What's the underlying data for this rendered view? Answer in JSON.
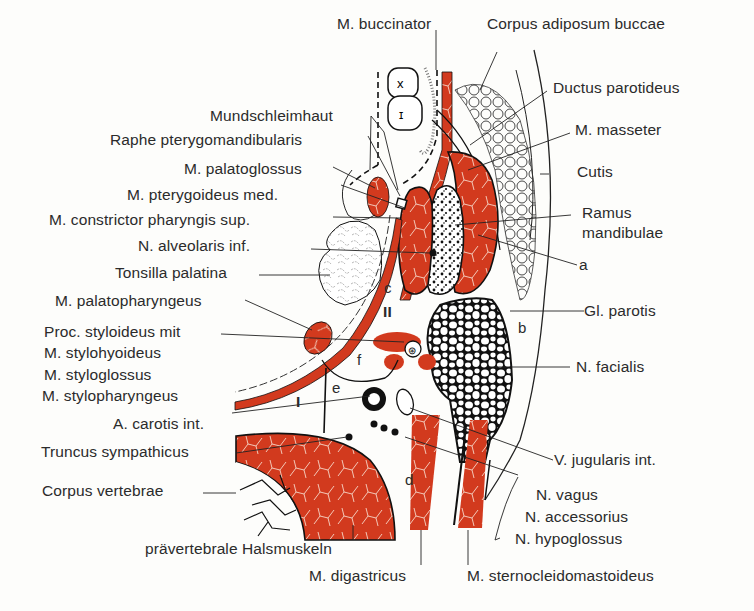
{
  "figure": {
    "colors": {
      "muscle": "#d23a1e",
      "muscle_fiber": "#f6d7c8",
      "outline": "#1a1a1a",
      "background": "#fdfdfb",
      "text": "#2b2b2b"
    },
    "labels_left": [
      {
        "id": "mundschleimhaut",
        "text": "Mundschleimhaut"
      },
      {
        "id": "raphe",
        "text": "Raphe pterygomandibularis"
      },
      {
        "id": "palatoglossus",
        "text": "M. palatoglossus"
      },
      {
        "id": "pterygoideus",
        "text": "M. pterygoideus med."
      },
      {
        "id": "constrictor",
        "text": "M. constrictor pharyngis sup."
      },
      {
        "id": "alveolaris",
        "text": "N. alveolaris inf."
      },
      {
        "id": "tonsilla",
        "text": "Tonsilla palatina"
      },
      {
        "id": "palatopharyngeus",
        "text": "M. palatopharyngeus"
      },
      {
        "id": "styloideus",
        "text": "Proc. styloideus mit"
      },
      {
        "id": "stylohyoideus",
        "text": "M. stylohyoideus"
      },
      {
        "id": "styloglossus",
        "text": "M. styloglossus"
      },
      {
        "id": "stylopharyngeus",
        "text": "M. stylopharyngeus"
      },
      {
        "id": "carotis",
        "text": "A. carotis int."
      },
      {
        "id": "sympathicus",
        "text": "Truncus sympathicus"
      },
      {
        "id": "vertebrae",
        "text": "Corpus vertebrae"
      }
    ],
    "labels_top": [
      {
        "id": "buccinator",
        "text": "M. buccinator"
      },
      {
        "id": "adiposum",
        "text": "Corpus adiposum buccae"
      }
    ],
    "labels_right": [
      {
        "id": "parotideus",
        "text": "Ductus parotideus"
      },
      {
        "id": "masseter",
        "text": "M. masseter"
      },
      {
        "id": "cutis",
        "text": "Cutis"
      },
      {
        "id": "ramus1",
        "text": "Ramus"
      },
      {
        "id": "ramus2",
        "text": "mandibulae"
      },
      {
        "id": "a",
        "text": "a"
      },
      {
        "id": "parotis",
        "text": "Gl. parotis"
      },
      {
        "id": "facialis",
        "text": "N. facialis"
      },
      {
        "id": "jugularis",
        "text": "V. jugularis int."
      },
      {
        "id": "vagus",
        "text": "N. vagus"
      },
      {
        "id": "accessorius",
        "text": "N. accessorius"
      },
      {
        "id": "hypoglossus",
        "text": "N. hypoglossus"
      }
    ],
    "labels_bottom": [
      {
        "id": "halsmuskeln",
        "text": "prävertebrale Halsmuskeln"
      },
      {
        "id": "digastricus",
        "text": "M. digastricus"
      },
      {
        "id": "sterno",
        "text": "M. sternocleidomastoideus"
      }
    ],
    "inline_letters": {
      "b": "b",
      "c": "c",
      "d": "d",
      "e": "e",
      "f": "f",
      "space_I": "I",
      "space_II": "II"
    }
  }
}
